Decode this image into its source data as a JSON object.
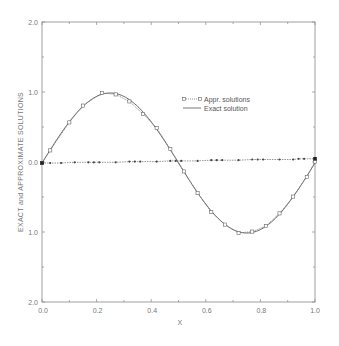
{
  "chart_data": {
    "type": "line",
    "title": "",
    "xlabel": "X",
    "ylabel": "EXACT and APPROXIMATE SOLUTIONS",
    "xlim": [
      0.0,
      1.0
    ],
    "ylim": [
      -2.0,
      2.0
    ],
    "grid": false,
    "legend_position": "upper right (inside plot, near x=0.5-0.85, y=0.8-1.0)",
    "x_ticks": [
      0.0,
      0.2,
      0.4,
      0.6,
      0.8,
      1.0
    ],
    "x_tick_labels": [
      "0.0",
      "0.2",
      "0.4",
      "0.6",
      "0.8",
      "1.0"
    ],
    "y_ticks": [
      2.0,
      1.0,
      0.0,
      -1.0,
      -2.0
    ],
    "y_tick_labels": [
      "2.0",
      "1.0",
      "0.0",
      "1.0",
      "2.0"
    ],
    "series": [
      {
        "name": "Appr. solutions",
        "style": "dotted line with square markers",
        "x": [
          0.0,
          0.03,
          0.1,
          0.15,
          0.22,
          0.27,
          0.32,
          0.37,
          0.42,
          0.47,
          0.52,
          0.57,
          0.62,
          0.67,
          0.72,
          0.77,
          0.82,
          0.87,
          0.92,
          0.97,
          1.0
        ],
        "values": [
          0.0,
          0.18,
          0.58,
          0.82,
          1.0,
          0.98,
          0.88,
          0.7,
          0.5,
          0.2,
          -0.12,
          -0.43,
          -0.7,
          -0.88,
          -1.0,
          -0.98,
          -0.9,
          -0.72,
          -0.48,
          -0.2,
          0.02
        ]
      },
      {
        "name": "Exact solution",
        "style": "solid line",
        "function": "sin(2*pi*x)",
        "x": [
          0.0,
          0.05,
          0.1,
          0.15,
          0.2,
          0.25,
          0.3,
          0.35,
          0.4,
          0.45,
          0.5,
          0.55,
          0.6,
          0.65,
          0.7,
          0.75,
          0.8,
          0.85,
          0.9,
          0.95,
          1.0
        ],
        "values": [
          0.0,
          0.31,
          0.59,
          0.81,
          0.95,
          1.0,
          0.95,
          0.81,
          0.59,
          0.31,
          0.0,
          -0.31,
          -0.59,
          -0.81,
          -0.95,
          -1.0,
          -0.95,
          -0.81,
          -0.59,
          -0.31,
          0.0
        ]
      },
      {
        "name": "Near-zero series (dotted with dot markers)",
        "style": "dotted line with small filled markers",
        "x": [
          0.0,
          0.03,
          0.07,
          0.12,
          0.17,
          0.19,
          0.21,
          0.27,
          0.32,
          0.34,
          0.36,
          0.42,
          0.47,
          0.49,
          0.51,
          0.57,
          0.62,
          0.64,
          0.66,
          0.72,
          0.77,
          0.79,
          0.81,
          0.87,
          0.92,
          0.94,
          0.96,
          1.0
        ],
        "values": [
          0.0,
          0.0,
          0.0,
          0.01,
          0.01,
          0.01,
          0.01,
          0.01,
          0.02,
          0.02,
          0.02,
          0.02,
          0.03,
          0.03,
          0.03,
          0.03,
          0.04,
          0.04,
          0.04,
          0.04,
          0.05,
          0.05,
          0.05,
          0.05,
          0.05,
          0.06,
          0.06,
          0.06
        ]
      }
    ]
  },
  "legend": {
    "items": [
      {
        "label": "Appr. solutions"
      },
      {
        "label": "Exact solution"
      }
    ]
  },
  "axes": {
    "xlabel": "X",
    "ylabel": "EXACT and APPROXIMATE SOLUTIONS",
    "x_tick_labels": [
      "0.0",
      "0.2",
      "0.4",
      "0.6",
      "0.8",
      "1.0"
    ],
    "y_tick_labels": [
      "2.0",
      "1.0",
      "0.0",
      "1.0",
      "2.0"
    ]
  }
}
